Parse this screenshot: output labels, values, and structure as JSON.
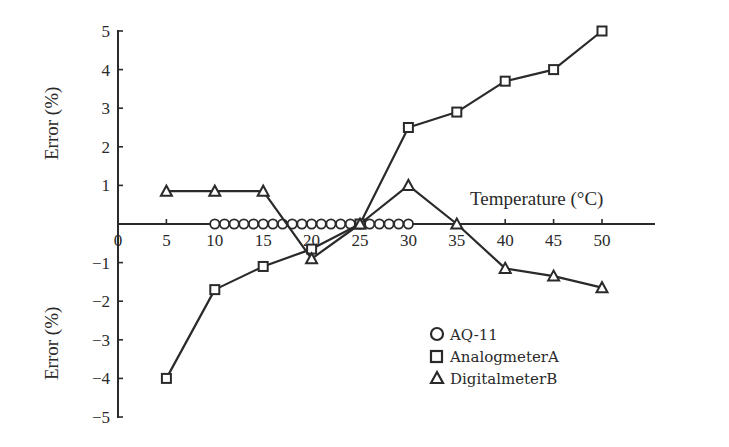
{
  "chart_data": {
    "type": "line",
    "title": "",
    "xlabel": "Temperature (°C)",
    "ylabel_top": "Error (%)",
    "ylabel_bottom": "Error (%)",
    "xlim": [
      0,
      55
    ],
    "ylim": [
      -5,
      5
    ],
    "x_ticks": [
      0,
      5,
      10,
      15,
      20,
      25,
      30,
      35,
      40,
      45,
      50
    ],
    "y_ticks": [
      5,
      4,
      3,
      2,
      1,
      -1,
      -2,
      -3,
      -4,
      -5
    ],
    "grid": false,
    "legend_position": "lower right",
    "series": [
      {
        "name": "AQ-11",
        "marker": "circle",
        "x": [
          10,
          11,
          12,
          13,
          14,
          15,
          16,
          17,
          18,
          19,
          20,
          21,
          22,
          23,
          24,
          25,
          26,
          27,
          28,
          29,
          30
        ],
        "values": [
          0,
          0,
          0,
          0,
          0,
          0,
          0,
          0,
          0,
          0,
          0,
          0,
          0,
          0,
          0,
          0,
          0,
          0,
          0,
          0,
          0
        ]
      },
      {
        "name": "AnalogmeterA",
        "marker": "square",
        "x": [
          5,
          10,
          15,
          20,
          25,
          30,
          35,
          40,
          45,
          50
        ],
        "values": [
          -4.0,
          -1.7,
          -1.1,
          -0.65,
          0.0,
          2.5,
          2.9,
          3.7,
          4.0,
          5.0
        ]
      },
      {
        "name": "DigitalmeterB",
        "marker": "triangle",
        "x": [
          5,
          10,
          15,
          20,
          25,
          30,
          35,
          40,
          45,
          50
        ],
        "values": [
          0.85,
          0.85,
          0.85,
          -0.9,
          0.0,
          1.0,
          0.0,
          -1.15,
          -1.35,
          -1.65
        ]
      }
    ]
  },
  "legend": {
    "items": [
      {
        "marker": "circle-icon",
        "label": "AQ-11"
      },
      {
        "marker": "square-icon",
        "label": "AnalogmeterA"
      },
      {
        "marker": "triangle-icon",
        "label": "DigitalmeterB"
      }
    ]
  },
  "labels": {
    "x_axis": "Temperature (°C)",
    "y_axis_top": "Error (%)",
    "y_axis_bottom": "Error (%)"
  }
}
